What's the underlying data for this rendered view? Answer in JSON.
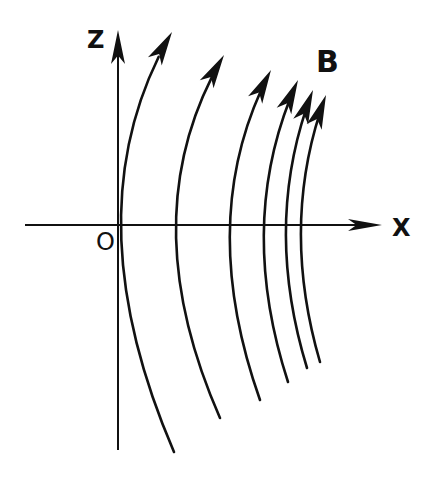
{
  "diagram": {
    "labels": {
      "z_axis": "Z",
      "x_axis": "X",
      "origin": "O",
      "field": "B"
    },
    "colors": {
      "stroke": "#111111",
      "background": "#ffffff"
    },
    "axes": {
      "z": {
        "x": 118,
        "y_top": 30,
        "y_bottom": 450
      },
      "x": {
        "y": 225,
        "x_left": 25,
        "x_right": 382
      }
    },
    "field_lines": [
      {
        "top": [
          172,
          32
        ],
        "mid": [
          121,
          225
        ],
        "bottom": [
          174,
          452
        ]
      },
      {
        "top": [
          224,
          55
        ],
        "mid": [
          176,
          225
        ],
        "bottom": [
          220,
          418
        ]
      },
      {
        "top": [
          271,
          70
        ],
        "mid": [
          230,
          225
        ],
        "bottom": [
          260,
          400
        ]
      },
      {
        "top": [
          298,
          80
        ],
        "mid": [
          264,
          225
        ],
        "bottom": [
          288,
          382
        ]
      },
      {
        "top": [
          313,
          90
        ],
        "mid": [
          286,
          225
        ],
        "bottom": [
          307,
          368
        ]
      },
      {
        "top": [
          326,
          95
        ],
        "mid": [
          301,
          225
        ],
        "bottom": [
          320,
          362
        ]
      }
    ]
  }
}
